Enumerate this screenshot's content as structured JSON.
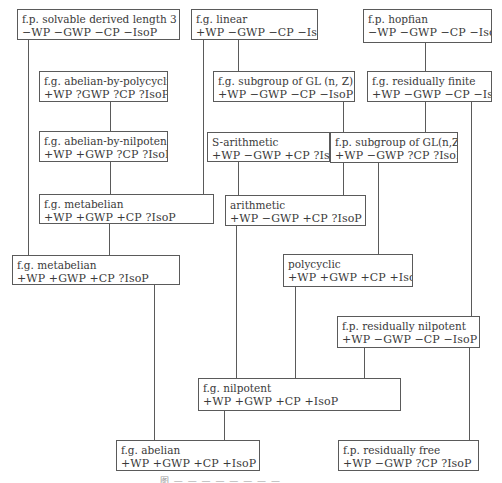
{
  "nodes": [
    {
      "id": "fp-solvable-dl3",
      "name": "f.p. solvable derived length 3",
      "props": "−WP −GWP −CP −IsoP",
      "box": [
        17,
        9,
        163,
        31
      ]
    },
    {
      "id": "fg-linear",
      "name": "f.g. linear",
      "props": "+WP −GWP −CP −IsoP",
      "box": [
        191,
        9,
        127,
        31
      ]
    },
    {
      "id": "fp-hopfian",
      "name": "f.p. hopfian",
      "props": "−WP −GWP −CP −IsoP",
      "box": [
        363,
        9,
        129,
        34
      ]
    },
    {
      "id": "fg-abelian-by-polycyclic",
      "name": "f.g. abelian-by-polycyclic",
      "props": "+WP ?GWP ?CP ?IsoP",
      "box": [
        39,
        71,
        129,
        31
      ]
    },
    {
      "id": "fg-subgroup-gl",
      "name": "f.g. subgroup of GL (n, Z)",
      "props": "+WP −GWP −CP −IsoP",
      "box": [
        213,
        71,
        142,
        31
      ]
    },
    {
      "id": "fg-residually-finite",
      "name": "f.g. residually finite",
      "props": "+WP −GWP −CP −IsoP",
      "box": [
        367,
        71,
        125,
        31
      ]
    },
    {
      "id": "fg-abelian-by-nilpoten",
      "name": "f.g. abelian-by-nilpoten",
      "props": "+WP +GWP ?CP ?IsoP",
      "box": [
        39,
        131,
        129,
        31
      ]
    },
    {
      "id": "s-arithmetic",
      "name": "S-arithmetic",
      "props": "+WP −GWP +CP ?IsoP",
      "box": [
        207,
        132,
        123,
        30
      ]
    },
    {
      "id": "fp-subgroup-gl",
      "name": "f.p. subgroup of GL(n,Z)",
      "props": "+WP −GWP ?CP ?IsoP",
      "box": [
        330,
        132,
        128,
        31
      ]
    },
    {
      "id": "fg-metabelian-1",
      "name": "f.g. metabelian",
      "props": "+WP +GWP +CP ?IsoP",
      "box": [
        39,
        194,
        175,
        30
      ]
    },
    {
      "id": "arithmetic",
      "name": "arithmetic",
      "props": "+WP −GWP +CP ?IsoP",
      "box": [
        225,
        195,
        141,
        31
      ]
    },
    {
      "id": "fg-metabelian-2",
      "name": "f.g. metabelian",
      "props": "+WP +GWP +CP ?IsoP",
      "box": [
        12,
        255,
        168,
        30
      ]
    },
    {
      "id": "polycyclic",
      "name": "polycyclic",
      "props": "+WP +GWP +CP +IsoP",
      "box": [
        283,
        254,
        130,
        33
      ]
    },
    {
      "id": "fp-residually-nilpotent",
      "name": "f.p. residually nilpotent",
      "props": "+WP −GWP −CP −IsoP",
      "box": [
        337,
        316,
        143,
        32
      ]
    },
    {
      "id": "fg-nilpotent",
      "name": "f.g. nilpotent",
      "props": "+WP +GWP +CP +IsoP",
      "box": [
        198,
        378,
        203,
        33
      ]
    },
    {
      "id": "fg-abelian",
      "name": "f.g. abelian",
      "props": "+WP +GWP +CP +IsoP",
      "box": [
        116,
        440,
        144,
        31
      ]
    },
    {
      "id": "fp-residually-free",
      "name": "f.p. residually free",
      "props": "+WP −GWP ?CP ?IsoP",
      "box": [
        338,
        440,
        141,
        31
      ]
    }
  ],
  "edges": [
    {
      "from": "fp-solvable-dl3",
      "to": "fg-metabelian-2",
      "x": 28,
      "y1": 40,
      "y2": 255
    },
    {
      "from": "fg-linear",
      "to": "fg-metabelian-1",
      "x": 203,
      "y1": 40,
      "y2": 194
    },
    {
      "from": "fg-linear",
      "to": "fg-subgroup-gl",
      "x": 238,
      "y1": 40,
      "y2": 71
    },
    {
      "from": "fp-hopfian",
      "to": "fg-residually-finite",
      "x": 425,
      "y1": 43,
      "y2": 71
    },
    {
      "from": "fg-abelian-by-polycyclic",
      "to": "fg-abelian-by-nilpoten",
      "x": 110,
      "y1": 102,
      "y2": 131
    },
    {
      "from": "fg-subgroup-gl",
      "to": "fp-subgroup-gl",
      "x": 343,
      "y1": 102,
      "y2": 132
    },
    {
      "from": "fg-residually-finite",
      "to": "fp-subgroup-gl",
      "x": 425,
      "y1": 102,
      "y2": 132
    },
    {
      "from": "fg-residually-finite",
      "to": "fp-residually-nilpotent",
      "x": 471,
      "y1": 102,
      "y2": 316
    },
    {
      "from": "fg-abelian-by-nilpoten",
      "to": "fg-metabelian-1",
      "x": 110,
      "y1": 162,
      "y2": 194
    },
    {
      "from": "s-arithmetic",
      "to": "arithmetic",
      "x": 238,
      "y1": 162,
      "y2": 195
    },
    {
      "from": "fp-subgroup-gl",
      "to": "arithmetic",
      "x": 343,
      "y1": 163,
      "y2": 195
    },
    {
      "from": "fp-subgroup-gl",
      "to": "polycyclic",
      "x": 378,
      "y1": 163,
      "y2": 254
    },
    {
      "from": "fg-metabelian-1",
      "to": "fg-metabelian-2",
      "x": 109,
      "y1": 224,
      "y2": 255
    },
    {
      "from": "fg-metabelian-2",
      "to": "fg-abelian",
      "x": 154,
      "y1": 285,
      "y2": 440
    },
    {
      "from": "arithmetic",
      "to": "fg-nilpotent",
      "x": 236,
      "y1": 226,
      "y2": 378
    },
    {
      "from": "polycyclic",
      "to": "fg-nilpotent",
      "x": 295,
      "y1": 287,
      "y2": 378
    },
    {
      "from": "fp-residually-nilpotent",
      "to": "fg-nilpotent",
      "x": 364,
      "y1": 348,
      "y2": 378
    },
    {
      "from": "fp-residually-nilpotent",
      "to": "fp-residually-free",
      "x": 469,
      "y1": 348,
      "y2": 440
    },
    {
      "from": "fg-nilpotent",
      "to": "fg-abelian",
      "x": 224,
      "y1": 411,
      "y2": 440
    }
  ],
  "caption": "图 — — — — — — — —"
}
